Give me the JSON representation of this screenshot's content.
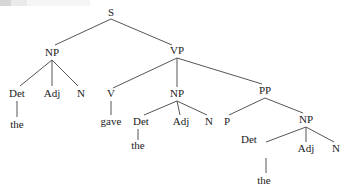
{
  "diagram": {
    "type": "syntax-tree",
    "nodes": [
      {
        "id": "S",
        "label": "S",
        "x": 111,
        "y": 16
      },
      {
        "id": "NP1",
        "label": "NP",
        "x": 52,
        "y": 56
      },
      {
        "id": "VP",
        "label": "VP",
        "x": 177,
        "y": 54
      },
      {
        "id": "Det1",
        "label": "Det",
        "x": 17,
        "y": 97
      },
      {
        "id": "Adj1",
        "label": "Adj",
        "x": 52,
        "y": 97
      },
      {
        "id": "N1",
        "label": "N",
        "x": 81,
        "y": 97
      },
      {
        "id": "the1",
        "label": "the",
        "x": 17,
        "y": 128
      },
      {
        "id": "V",
        "label": "V",
        "x": 111,
        "y": 97
      },
      {
        "id": "gave",
        "label": "gave",
        "x": 111,
        "y": 125
      },
      {
        "id": "NP2",
        "label": "NP",
        "x": 177,
        "y": 97
      },
      {
        "id": "Det2",
        "label": "Det",
        "x": 141,
        "y": 125
      },
      {
        "id": "Adj2",
        "label": "Adj",
        "x": 181,
        "y": 125
      },
      {
        "id": "N2",
        "label": "N",
        "x": 209,
        "y": 125
      },
      {
        "id": "the2",
        "label": "the",
        "x": 138,
        "y": 149
      },
      {
        "id": "PP",
        "label": "PP",
        "x": 265,
        "y": 94
      },
      {
        "id": "P",
        "label": "P",
        "x": 227,
        "y": 125
      },
      {
        "id": "NP3",
        "label": "NP",
        "x": 306,
        "y": 123
      },
      {
        "id": "Det3",
        "label": "Det",
        "x": 249,
        "y": 143
      },
      {
        "id": "Adj3",
        "label": "Adj",
        "x": 306,
        "y": 152
      },
      {
        "id": "N3",
        "label": "N",
        "x": 336,
        "y": 152
      },
      {
        "id": "the3",
        "label": "the",
        "x": 264,
        "y": 184
      }
    ],
    "edges": [
      {
        "from": [
          111,
          19
        ],
        "to": [
          55,
          45
        ]
      },
      {
        "from": [
          111,
          19
        ],
        "to": [
          172,
          45
        ]
      },
      {
        "from": [
          52,
          60
        ],
        "to": [
          20,
          86
        ]
      },
      {
        "from": [
          52,
          60
        ],
        "to": [
          52,
          86
        ]
      },
      {
        "from": [
          52,
          60
        ],
        "to": [
          78,
          86
        ]
      },
      {
        "from": [
          17,
          101
        ],
        "to": [
          17,
          117
        ]
      },
      {
        "from": [
          177,
          58
        ],
        "to": [
          113,
          88
        ]
      },
      {
        "from": [
          177,
          58
        ],
        "to": [
          177,
          87
        ]
      },
      {
        "from": [
          177,
          58
        ],
        "to": [
          262,
          84
        ]
      },
      {
        "from": [
          111,
          101
        ],
        "to": [
          111,
          115
        ]
      },
      {
        "from": [
          177,
          101
        ],
        "to": [
          144,
          115
        ]
      },
      {
        "from": [
          177,
          101
        ],
        "to": [
          180,
          115
        ]
      },
      {
        "from": [
          177,
          101
        ],
        "to": [
          207,
          115
        ]
      },
      {
        "from": [
          138,
          129
        ],
        "to": [
          138,
          140
        ]
      },
      {
        "from": [
          265,
          98
        ],
        "to": [
          229,
          115
        ]
      },
      {
        "from": [
          265,
          98
        ],
        "to": [
          303,
          113
        ]
      },
      {
        "from": [
          306,
          127
        ],
        "to": [
          266,
          142
        ]
      },
      {
        "from": [
          306,
          127
        ],
        "to": [
          306,
          142
        ]
      },
      {
        "from": [
          306,
          127
        ],
        "to": [
          334,
          142
        ]
      },
      {
        "from": [
          266,
          158
        ],
        "to": [
          266,
          173
        ]
      }
    ]
  }
}
